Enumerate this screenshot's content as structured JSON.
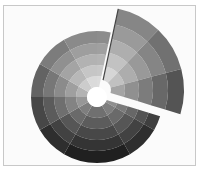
{
  "image": {
    "description": "Grayscale radial sunburst icon with one exploded wedge",
    "frame_color": "#c8c8c8",
    "background": "#fbfbfb",
    "hole_color": "#ffffff"
  },
  "disc": {
    "cx": 97,
    "cy": 97,
    "ring_radii": [
      10,
      21,
      32,
      43,
      54,
      66
    ],
    "sector_count": 12,
    "wedge_start_deg": -78,
    "wedge_end_deg": 17
  },
  "wedge": {
    "cx": 101,
    "cy": 90,
    "outer_radius": 83,
    "ring_radii": [
      10,
      24,
      38,
      52,
      67,
      83
    ]
  }
}
